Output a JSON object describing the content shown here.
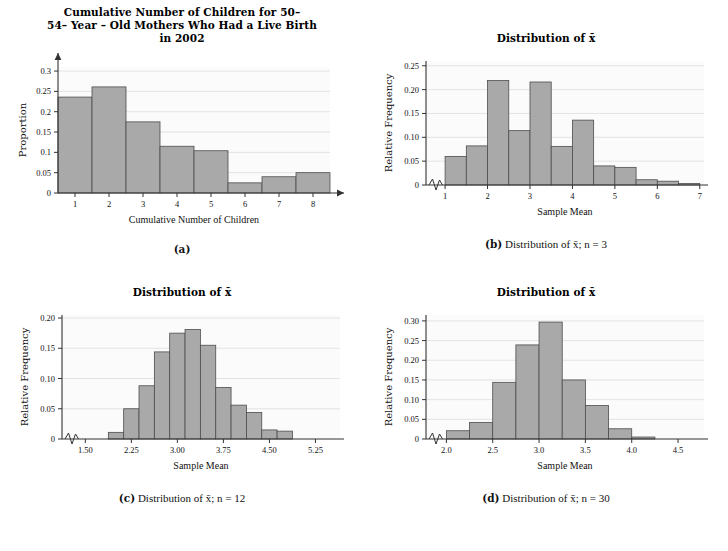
{
  "figure": {
    "panels": [
      "a",
      "b",
      "c",
      "d"
    ]
  },
  "panel_a": {
    "title_line1": "Cumulative Number of Children for 50–",
    "title_line2": "54– Year – Old Mothers Who Had a Live Birth",
    "title_line3": "in 2002",
    "caption_label": "(a)",
    "caption_text": ""
  },
  "panel_b": {
    "title": "Distribution of x̄",
    "caption_label": "(b)",
    "caption_text": "Distribution of x̄; n = 3"
  },
  "panel_c": {
    "title": "Distribution of x̄",
    "caption_label": "(c)",
    "caption_text": "Distribution of x̄; n = 12"
  },
  "panel_d": {
    "title": "Distribution of x̄",
    "caption_label": "(d)",
    "caption_text": "Distribution of x̄; n = 30"
  },
  "colors": {
    "bar_fill": "#a9a9a9",
    "bar_stroke": "#4d4d4d",
    "grid": "#d9d9d9",
    "axis": "#333333",
    "plot_bg": "#fbfbfb"
  },
  "chart_data": [
    {
      "id": "a",
      "type": "bar",
      "title": "Cumulative Number of Children for 50–54– Year – Old Mothers Who Had a Live Birth in 2002",
      "xlabel": "Cumulative Number of Children",
      "ylabel": "Proportion",
      "xlim": [
        0.5,
        8.5
      ],
      "ylim": [
        0,
        0.31
      ],
      "xticks": [
        1,
        2,
        3,
        4,
        5,
        6,
        7,
        8
      ],
      "xticklabels": [
        "1",
        "2",
        "3",
        "4",
        "5",
        "6",
        "7",
        "8"
      ],
      "yticks": [
        0,
        0.05,
        0.1,
        0.15,
        0.2,
        0.25,
        0.3
      ],
      "yticklabels": [
        "0",
        "0.05",
        "0.1",
        "0.15",
        "0.2",
        "0.25",
        "0.3"
      ],
      "grid": true,
      "bar_width": 1,
      "categories": [
        "1",
        "2",
        "3",
        "4",
        "5",
        "6",
        "7",
        "8"
      ],
      "bin_edges": [
        0.5,
        1.5,
        2.5,
        3.5,
        4.5,
        5.5,
        6.5,
        7.5,
        8.5
      ],
      "values": [
        0.236,
        0.261,
        0.175,
        0.115,
        0.104,
        0.025,
        0.04,
        0.05
      ],
      "axis_arrows": true,
      "axis_break": false
    },
    {
      "id": "b",
      "type": "bar",
      "title": "Distribution of x̄",
      "xlabel": "Sample Mean",
      "ylabel": "Relative Frequency",
      "xlim": [
        0.55,
        7.1
      ],
      "ylim": [
        0,
        0.26
      ],
      "xticks": [
        1,
        2,
        3,
        4,
        5,
        6,
        7
      ],
      "xticklabels": [
        "1",
        "2",
        "3",
        "4",
        "5",
        "6",
        "7"
      ],
      "yticks": [
        0,
        0.05,
        0.1,
        0.15,
        0.2,
        0.25
      ],
      "yticklabels": [
        "0",
        "0.05",
        "0.10",
        "0.15",
        "0.20",
        "0.25"
      ],
      "grid": true,
      "bar_width": 0.5,
      "bin_edges": [
        1.0,
        1.5,
        2.0,
        2.5,
        3.0,
        3.5,
        4.0,
        4.5,
        5.0,
        5.5,
        6.0,
        6.5,
        7.0
      ],
      "values": [
        0.06,
        0.082,
        0.219,
        0.114,
        0.216,
        0.081,
        0.136,
        0.04,
        0.037,
        0.011,
        0.008,
        0.003
      ],
      "axis_arrows": false,
      "axis_break": true
    },
    {
      "id": "c",
      "type": "bar",
      "title": "Distribution of x̄",
      "xlabel": "Sample Mean",
      "ylabel": "Relative Frequency",
      "xlim": [
        1.12,
        5.65
      ],
      "ylim": [
        0,
        0.205
      ],
      "xticks": [
        1.5,
        2.25,
        3.0,
        3.75,
        4.5,
        5.25
      ],
      "xticklabels": [
        "1.50",
        "2.25",
        "3.00",
        "3.75",
        "4.50",
        "5.25"
      ],
      "yticks": [
        0,
        0.05,
        0.1,
        0.15,
        0.2
      ],
      "yticklabels": [
        "0",
        "0.05",
        "0.10",
        "0.15",
        "0.20"
      ],
      "grid": true,
      "bar_width": 0.25,
      "bin_edges": [
        1.875,
        2.125,
        2.375,
        2.625,
        2.875,
        3.125,
        3.375,
        3.625,
        3.875,
        4.125,
        4.375,
        4.625
      ],
      "values": [
        0.011,
        0.05,
        0.088,
        0.144,
        0.175,
        0.181,
        0.155,
        0.085,
        0.056,
        0.044,
        0.015
      ],
      "extra_bar": {
        "edges": [
          4.625,
          4.875
        ],
        "value": 0.013
      },
      "axis_arrows": false,
      "axis_break": true
    },
    {
      "id": "d",
      "type": "bar",
      "title": "Distribution of x̄",
      "xlabel": "Sample Mean",
      "ylabel": "Relative Frequency",
      "xlim": [
        1.78,
        4.78
      ],
      "ylim": [
        0,
        0.315
      ],
      "xticks": [
        2.0,
        2.5,
        3.0,
        3.5,
        4.0,
        4.5
      ],
      "xticklabels": [
        "2.0",
        "2.5",
        "3.0",
        "3.5",
        "4.0",
        "4.5"
      ],
      "yticks": [
        0,
        0.05,
        0.1,
        0.15,
        0.2,
        0.25,
        0.3
      ],
      "yticklabels": [
        "0",
        "0.05",
        "0.10",
        "0.15",
        "0.20",
        "0.25",
        "0.30"
      ],
      "grid": true,
      "bar_width": 0.25,
      "bin_edges": [
        2.0,
        2.25,
        2.5,
        2.75,
        3.0,
        3.25,
        3.5,
        3.75,
        4.0,
        4.25
      ],
      "values": [
        0.021,
        0.042,
        0.144,
        0.239,
        0.297,
        0.15,
        0.085,
        0.026,
        0.005
      ],
      "axis_arrows": false,
      "axis_break": true
    }
  ]
}
